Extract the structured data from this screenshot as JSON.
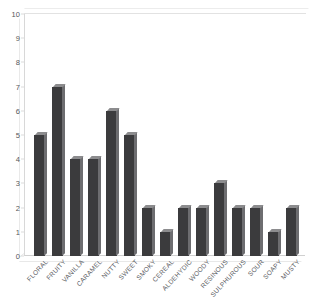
{
  "chart_data": {
    "type": "bar",
    "title": "",
    "subtitle": "",
    "xlabel": "",
    "ylabel": "",
    "ylim": [
      0,
      10
    ],
    "ytick_labels": [
      "10",
      "9",
      "8",
      "7",
      "6",
      "5",
      "4",
      "3",
      "2",
      "1",
      "0"
    ],
    "ytick_values": [
      10,
      9,
      8,
      7,
      6,
      5,
      4,
      3,
      2,
      1,
      0
    ],
    "grid": false,
    "legend": null,
    "legend_position": "none",
    "style": "3d-bar",
    "bar_color": "#3b3b3d",
    "bar_cap_color": "#8c8c8e",
    "bar_side_color": "#6d6d70",
    "frame_color": "#d8d8d8",
    "categories": [
      "FLORAL",
      "FRUITY",
      "VANILLA",
      "CARAMEL",
      "NUTTY",
      "SWEET",
      "SMOKY",
      "CEREAL",
      "ALDEHYDIC",
      "WOODY",
      "RESINOUS",
      "SULPHUROUS",
      "SOUR",
      "SOAPY",
      "MUSTY"
    ],
    "values": [
      5,
      7,
      4,
      4,
      6,
      5,
      2,
      1,
      2,
      2,
      3,
      2,
      2,
      1,
      2
    ],
    "points": [
      {
        "category": "FLORAL",
        "value": 5
      },
      {
        "category": "FRUITY",
        "value": 7
      },
      {
        "category": "VANILLA",
        "value": 4
      },
      {
        "category": "CARAMEL",
        "value": 4
      },
      {
        "category": "NUTTY",
        "value": 6
      },
      {
        "category": "SWEET",
        "value": 5
      },
      {
        "category": "SMOKY",
        "value": 2
      },
      {
        "category": "CEREAL",
        "value": 1
      },
      {
        "category": "ALDEHYDIC",
        "value": 2
      },
      {
        "category": "WOODY",
        "value": 2
      },
      {
        "category": "RESINOUS",
        "value": 3
      },
      {
        "category": "SULPHUROUS",
        "value": 2
      },
      {
        "category": "SOUR",
        "value": 2
      },
      {
        "category": "SOAPY",
        "value": 1
      },
      {
        "category": "MUSTY",
        "value": 2
      }
    ]
  }
}
